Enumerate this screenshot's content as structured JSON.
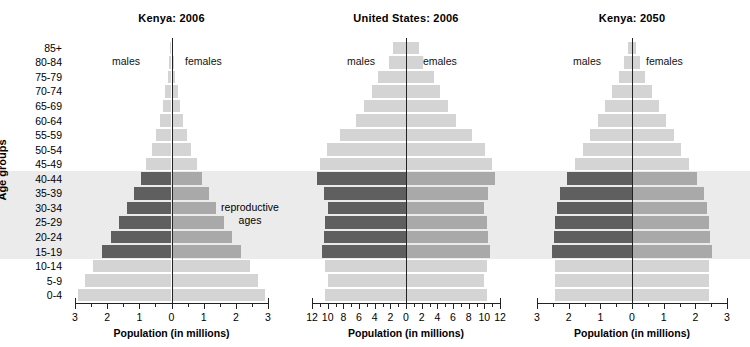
{
  "figure": {
    "y_axis_title": "Age groups",
    "age_groups": [
      "85+",
      "80-84",
      "75-79",
      "70-74",
      "65-69",
      "60-64",
      "55-59",
      "50-54",
      "45-49",
      "40-44",
      "35-39",
      "30-34",
      "25-29",
      "20-24",
      "15-19",
      "10-14",
      "5-9",
      "0-4"
    ],
    "reproductive_annotation_line1": "reproductive",
    "reproductive_annotation_line2": "ages",
    "male_label": "males",
    "female_label": "females",
    "x_axis_title": "Population (in millions)",
    "colors": {
      "bar_light": "#d4d4d4",
      "bar_male_highlight": "#5f5f5f",
      "bar_female_highlight": "#a9a9a9",
      "band_background": "#ebebeb",
      "axis": "#222222",
      "text": "#000000"
    }
  },
  "chart_data": [
    {
      "type": "bar",
      "subtype": "population-pyramid",
      "title": "Kenya:  2006",
      "xlabel": "Population (in millions)",
      "ylabel": "Age groups",
      "xlim": [
        -3,
        3
      ],
      "xticks": [
        3,
        2,
        1,
        0,
        1,
        2,
        3
      ],
      "xtick_labels": [
        "3",
        "2",
        "1",
        "0",
        "1",
        "2",
        "3"
      ],
      "minor_tick_step": 0.5,
      "grid": false,
      "legend": "inline",
      "categories": [
        "85+",
        "80-84",
        "75-79",
        "70-74",
        "65-69",
        "60-64",
        "55-59",
        "50-54",
        "45-49",
        "40-44",
        "35-39",
        "30-34",
        "25-29",
        "20-24",
        "15-19",
        "10-14",
        "5-9",
        "0-4"
      ],
      "highlight_categories": [
        "40-44",
        "35-39",
        "30-34",
        "25-29",
        "20-24",
        "15-19"
      ],
      "highlight_label": "reproductive ages",
      "series": [
        {
          "name": "males",
          "values": [
            0.05,
            0.08,
            0.12,
            0.19,
            0.27,
            0.37,
            0.48,
            0.61,
            0.78,
            0.96,
            1.16,
            1.38,
            1.62,
            1.88,
            2.15,
            2.45,
            2.7,
            2.9
          ]
        },
        {
          "name": "females",
          "values": [
            0.05,
            0.08,
            0.12,
            0.19,
            0.27,
            0.37,
            0.48,
            0.61,
            0.78,
            0.96,
            1.16,
            1.38,
            1.62,
            1.88,
            2.15,
            2.45,
            2.7,
            2.9
          ]
        }
      ]
    },
    {
      "type": "bar",
      "subtype": "population-pyramid",
      "title": "United States:  2006",
      "xlabel": "Population (in millions)",
      "ylabel": "Age groups",
      "xlim": [
        -12,
        12
      ],
      "xticks": [
        12,
        10,
        8,
        6,
        4,
        2,
        0,
        2,
        4,
        6,
        8,
        10,
        12
      ],
      "xtick_labels": [
        "12",
        "10",
        "8",
        "6",
        "4",
        "2",
        "0",
        "2",
        "4",
        "6",
        "8",
        "10",
        "12"
      ],
      "minor_tick_step": 1,
      "grid": false,
      "legend": "inline",
      "categories": [
        "85+",
        "80-84",
        "75-79",
        "70-74",
        "65-69",
        "60-64",
        "55-59",
        "50-54",
        "45-49",
        "40-44",
        "35-39",
        "30-34",
        "25-29",
        "20-24",
        "15-19",
        "10-14",
        "5-9",
        "0-4"
      ],
      "highlight_categories": [
        "40-44",
        "35-39",
        "30-34",
        "25-29",
        "20-24",
        "15-19"
      ],
      "highlight_label": "reproductive ages",
      "series": [
        {
          "name": "males",
          "values": [
            1.7,
            2.2,
            3.6,
            4.3,
            5.3,
            6.4,
            8.4,
            10.1,
            11.0,
            11.3,
            10.5,
            10.0,
            10.4,
            10.5,
            10.7,
            10.3,
            9.9,
            10.3
          ]
        },
        {
          "name": "females",
          "values": [
            1.7,
            2.2,
            3.6,
            4.3,
            5.3,
            6.4,
            8.4,
            10.1,
            11.0,
            11.3,
            10.5,
            10.0,
            10.4,
            10.5,
            10.7,
            10.3,
            9.9,
            10.3
          ]
        }
      ]
    },
    {
      "type": "bar",
      "subtype": "population-pyramid",
      "title": "Kenya:  2050",
      "xlabel": "Population (in millions)",
      "ylabel": "Age groups",
      "xlim": [
        -3,
        3
      ],
      "xticks": [
        3,
        2,
        1,
        0,
        1,
        2,
        3
      ],
      "xtick_labels": [
        "3",
        "2",
        "1",
        "0",
        "1",
        "2",
        "3"
      ],
      "minor_tick_step": 0.5,
      "grid": false,
      "legend": "inline",
      "categories": [
        "85+",
        "80-84",
        "75-79",
        "70-74",
        "65-69",
        "60-64",
        "55-59",
        "50-54",
        "45-49",
        "40-44",
        "35-39",
        "30-34",
        "25-29",
        "20-24",
        "15-19",
        "10-14",
        "5-9",
        "0-4"
      ],
      "highlight_categories": [
        "40-44",
        "35-39",
        "30-34",
        "25-29",
        "20-24",
        "15-19"
      ],
      "highlight_label": "reproductive ages",
      "series": [
        {
          "name": "males",
          "values": [
            0.13,
            0.26,
            0.42,
            0.62,
            0.85,
            1.08,
            1.32,
            1.55,
            1.8,
            2.05,
            2.28,
            2.38,
            2.42,
            2.45,
            2.52,
            2.42,
            2.42,
            2.42
          ]
        },
        {
          "name": "females",
          "values": [
            0.13,
            0.26,
            0.42,
            0.62,
            0.85,
            1.08,
            1.32,
            1.55,
            1.8,
            2.05,
            2.28,
            2.38,
            2.42,
            2.45,
            2.52,
            2.42,
            2.42,
            2.42
          ]
        }
      ]
    }
  ]
}
